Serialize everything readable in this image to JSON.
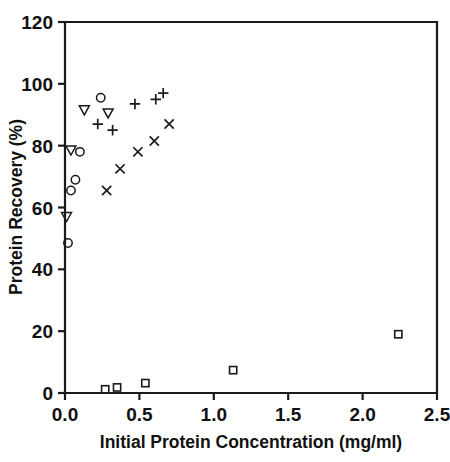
{
  "chart_data": {
    "type": "scatter",
    "title": "",
    "xlabel": "Initial Protein Concentration  (mg/ml)",
    "ylabel": "Protein Recovery (%)",
    "xlim": [
      0.0,
      2.5
    ],
    "ylim": [
      0,
      120
    ],
    "xticks": [
      "0.0",
      "0.5",
      "1.0",
      "1.5",
      "2.0",
      "2.5"
    ],
    "xtick_values": [
      0.0,
      0.5,
      1.0,
      1.5,
      2.0,
      2.5
    ],
    "yticks": [
      "0",
      "20",
      "40",
      "60",
      "80",
      "100",
      "120"
    ],
    "ytick_values": [
      0,
      20,
      40,
      60,
      80,
      100,
      120
    ],
    "grid": false,
    "legend": "none",
    "series": [
      {
        "name": "circle-series",
        "marker": "circle",
        "points": [
          {
            "x": 0.02,
            "y": 48.5
          },
          {
            "x": 0.04,
            "y": 65.5
          },
          {
            "x": 0.07,
            "y": 69.0
          },
          {
            "x": 0.1,
            "y": 78.0
          },
          {
            "x": 0.24,
            "y": 95.5
          }
        ]
      },
      {
        "name": "triangle-series",
        "marker": "triangle-down",
        "points": [
          {
            "x": 0.01,
            "y": 57.0
          },
          {
            "x": 0.04,
            "y": 78.5
          },
          {
            "x": 0.13,
            "y": 91.5
          },
          {
            "x": 0.29,
            "y": 90.5
          }
        ]
      },
      {
        "name": "plus-series",
        "marker": "plus",
        "points": [
          {
            "x": 0.22,
            "y": 87.0
          },
          {
            "x": 0.32,
            "y": 85.0
          },
          {
            "x": 0.47,
            "y": 93.5
          },
          {
            "x": 0.61,
            "y": 95.0
          },
          {
            "x": 0.66,
            "y": 97.0
          }
        ]
      },
      {
        "name": "ex-series",
        "marker": "x",
        "points": [
          {
            "x": 0.28,
            "y": 65.5
          },
          {
            "x": 0.37,
            "y": 72.5
          },
          {
            "x": 0.49,
            "y": 78.0
          },
          {
            "x": 0.6,
            "y": 81.5
          },
          {
            "x": 0.7,
            "y": 87.0
          }
        ]
      },
      {
        "name": "square-series",
        "marker": "square",
        "points": [
          {
            "x": 0.27,
            "y": 1.2
          },
          {
            "x": 0.35,
            "y": 1.8
          },
          {
            "x": 0.54,
            "y": 3.2
          },
          {
            "x": 1.13,
            "y": 7.4
          },
          {
            "x": 2.24,
            "y": 19.0
          }
        ]
      }
    ]
  }
}
